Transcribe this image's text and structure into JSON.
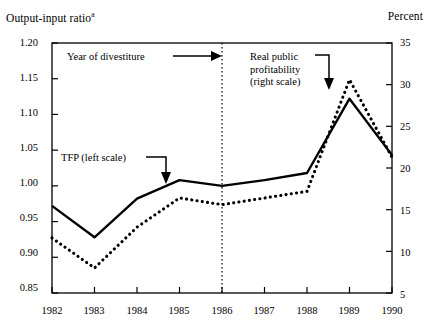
{
  "chart_data": {
    "type": "line",
    "title": "",
    "xlabel": "",
    "left_axis_title": "Output-input ratio",
    "left_axis_title_superscript": "a",
    "right_axis_title": "Percent",
    "categories": [
      "1982",
      "1983",
      "1984",
      "1985",
      "1986",
      "1987",
      "1988",
      "1989",
      "1990"
    ],
    "x": [
      1982,
      1983,
      1984,
      1985,
      1986,
      1987,
      1988,
      1989,
      1990
    ],
    "ylim_left": [
      0.85,
      1.2
    ],
    "ylim_right": [
      5,
      35
    ],
    "yticks_left": [
      "1.20",
      "1.15",
      "1.10",
      "1.05",
      "1.00",
      "0.95",
      "0.90",
      "0.85"
    ],
    "yticks_right": [
      "35",
      "30",
      "25",
      "20",
      "15",
      "10",
      "5"
    ],
    "grid": false,
    "legend_position": "inline-annotations",
    "series": [
      {
        "name": "TFP (left scale)",
        "axis": "left",
        "style": "solid",
        "values": [
          0.972,
          0.928,
          0.982,
          1.008,
          1.0,
          1.008,
          1.018,
          1.122,
          1.043
        ]
      },
      {
        "name": "Real public profitability (right scale)",
        "axis": "right",
        "style": "dotted",
        "values": [
          11.6,
          8.0,
          12.9,
          16.4,
          15.6,
          16.4,
          17.2,
          30.6,
          21.3
        ]
      }
    ],
    "annotations": [
      {
        "name": "year-of-divestiture",
        "text": "Year of divestiture",
        "points_to": "1986",
        "arrow": "right"
      },
      {
        "name": "real-public-profitability",
        "lines": [
          "Real public",
          "profitability",
          "(right scale)"
        ],
        "points_to": "dotted-series-1989",
        "arrow": "down"
      },
      {
        "name": "tfp",
        "text": "TFP (left scale)",
        "points_to": "solid-series-1985",
        "arrow": "down"
      }
    ],
    "divestiture_line": {
      "year": "1986",
      "style": "dotted-vertical"
    },
    "colors": {
      "line": "#000000",
      "axis": "#000000",
      "background": "#ffffff"
    }
  }
}
